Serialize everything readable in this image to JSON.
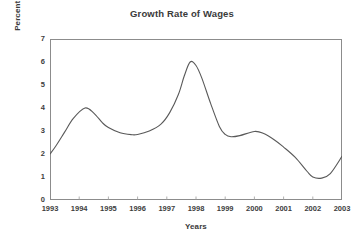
{
  "chart_data": {
    "type": "line",
    "title": "Growth Rate of Wages",
    "xlabel": "Years",
    "ylabel": "Percent of growth",
    "xlim": [
      1993,
      2003
    ],
    "ylim": [
      0,
      7
    ],
    "ytick_labels": [
      "0",
      "1",
      "2",
      "3",
      "4",
      "5",
      "6",
      "7"
    ],
    "ytick_values": [
      0,
      1,
      2,
      3,
      4,
      5,
      6,
      7
    ],
    "xtick_labels": [
      "1993",
      "1994",
      "1995",
      "1996",
      "1997",
      "1998",
      "1999",
      "2000",
      "2001",
      "2002",
      "2003"
    ],
    "xtick_values": [
      1993,
      1994,
      1995,
      1996,
      1997,
      1998,
      1999,
      2000,
      2001,
      2002,
      2003
    ],
    "grid": false,
    "legend": "none",
    "line_color": "#595959",
    "line_width": 1.1,
    "smoothing": "spline",
    "series": [
      {
        "name": "Percent of growth",
        "x": [
          1993.0,
          1993.2,
          1993.5,
          1993.8,
          1994.2,
          1994.5,
          1994.8,
          1995.0,
          1995.4,
          1995.8,
          1996.0,
          1996.4,
          1996.8,
          1997.1,
          1997.4,
          1997.6,
          1997.8,
          1998.0,
          1998.2,
          1998.5,
          1998.8,
          1999.0,
          1999.2,
          1999.5,
          2000.0,
          2000.3,
          2000.7,
          2001.0,
          2001.4,
          2001.8,
          2002.0,
          2002.3,
          2002.6,
          2003.0
        ],
        "y": [
          2.0,
          2.35,
          2.95,
          3.55,
          4.0,
          3.78,
          3.35,
          3.15,
          2.92,
          2.84,
          2.85,
          3.0,
          3.3,
          3.8,
          4.6,
          5.4,
          6.0,
          5.85,
          5.3,
          4.2,
          3.2,
          2.85,
          2.75,
          2.8,
          2.98,
          2.9,
          2.6,
          2.3,
          1.85,
          1.25,
          1.0,
          0.95,
          1.15,
          1.9
        ]
      }
    ],
    "annotations": {
      "peak_1994": 4.0,
      "peak_1998": 6.0,
      "trough_2002": 0.95,
      "start_1993": 2.0,
      "end_2003": 1.9
    }
  },
  "style": {
    "axis_color": "#8c8c8c",
    "text_color": "#3a3a3a",
    "background": "#ffffff"
  }
}
